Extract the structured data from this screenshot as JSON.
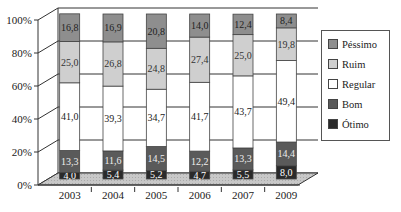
{
  "chart_data": {
    "type": "bar",
    "stacked": true,
    "percent": true,
    "style": "3d",
    "title": "",
    "xlabel": "",
    "ylabel": "",
    "ylim": [
      0,
      100
    ],
    "yticks": [
      "0%",
      "20%",
      "40%",
      "60%",
      "80%",
      "100%"
    ],
    "categories": [
      "2003",
      "2004",
      "2005",
      "2006",
      "2007",
      "2009"
    ],
    "series": [
      {
        "name": "Ótimo",
        "color": "#2a2a2a",
        "values": [
          4.0,
          5.4,
          5.2,
          4.7,
          5.5,
          8.0
        ],
        "labels": [
          "4,0",
          "5,4",
          "5,2",
          "4,7",
          "5,5",
          "8,0"
        ]
      },
      {
        "name": "Bom",
        "color": "#5a5a5a",
        "values": [
          13.3,
          11.6,
          14.5,
          12.2,
          13.3,
          14.4
        ],
        "labels": [
          "13,3",
          "11,6",
          "14,5",
          "12,2",
          "13,3",
          "14,4"
        ]
      },
      {
        "name": "Regular",
        "color": "#ffffff",
        "values": [
          41.0,
          39.3,
          34.7,
          41.7,
          43.7,
          49.4
        ],
        "labels": [
          "41,0",
          "39,3",
          "34,7",
          "41,7",
          "43,7",
          "49,4"
        ]
      },
      {
        "name": "Ruim",
        "color": "#cfcfcf",
        "values": [
          25.0,
          26.8,
          24.8,
          27.4,
          25.0,
          19.8
        ],
        "labels": [
          "25,0",
          "26,8",
          "24,8",
          "27,4",
          "25,0",
          "19,8"
        ]
      },
      {
        "name": "Péssimo",
        "color": "#8e8e8e",
        "values": [
          16.8,
          16.9,
          20.8,
          14.0,
          12.4,
          8.4
        ],
        "labels": [
          "16,8",
          "16,9",
          "20,8",
          "14,0",
          "12,4",
          "8,4"
        ]
      }
    ],
    "grid": true,
    "legend": {
      "position": "right",
      "entries": [
        "Péssimo",
        "Ruim",
        "Regular",
        "Bom",
        "Ótimo"
      ]
    }
  },
  "legend": {
    "items": [
      {
        "label": "Péssimo",
        "color": "#8e8e8e"
      },
      {
        "label": "Ruim",
        "color": "#cfcfcf"
      },
      {
        "label": "Regular",
        "color": "#ffffff"
      },
      {
        "label": "Bom",
        "color": "#5a5a5a"
      },
      {
        "label": "Ótimo",
        "color": "#2a2a2a"
      }
    ]
  }
}
